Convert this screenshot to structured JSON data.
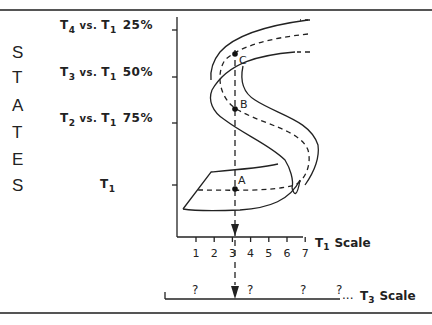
{
  "states_letters": [
    "S",
    "T",
    "A",
    "T",
    "E",
    "S"
  ],
  "state_labels": [
    {
      "main": "T",
      "sub": "4",
      "vs": "vs.",
      "ref": "T",
      "ref_sub": "1",
      "pct": "25%"
    },
    {
      "main": "T",
      "sub": "3",
      "vs": "vs.",
      "ref": "T",
      "ref_sub": "1",
      "pct": "50%"
    },
    {
      "main": "T",
      "sub": "2",
      "vs": "vs.",
      "ref": "T",
      "ref_sub": "1",
      "pct": "75%"
    },
    {
      "main": "T",
      "sub": "1",
      "vs": "",
      "ref": "",
      "ref_sub": "",
      "pct": ""
    }
  ],
  "x_axis": {
    "title_main": "T",
    "title_sub": "1",
    "title_rest": "Scale",
    "ticks": [
      "1",
      "2",
      "3",
      "4",
      "5",
      "6",
      "7"
    ]
  },
  "t3_scale": {
    "marks": [
      "?",
      "?",
      "?",
      "?"
    ],
    "ellipsis": "...",
    "title_main": "T",
    "title_sub": "3",
    "title_rest": "Scale"
  },
  "points": [
    {
      "label": "A"
    },
    {
      "label": "B"
    },
    {
      "label": "C"
    }
  ]
}
